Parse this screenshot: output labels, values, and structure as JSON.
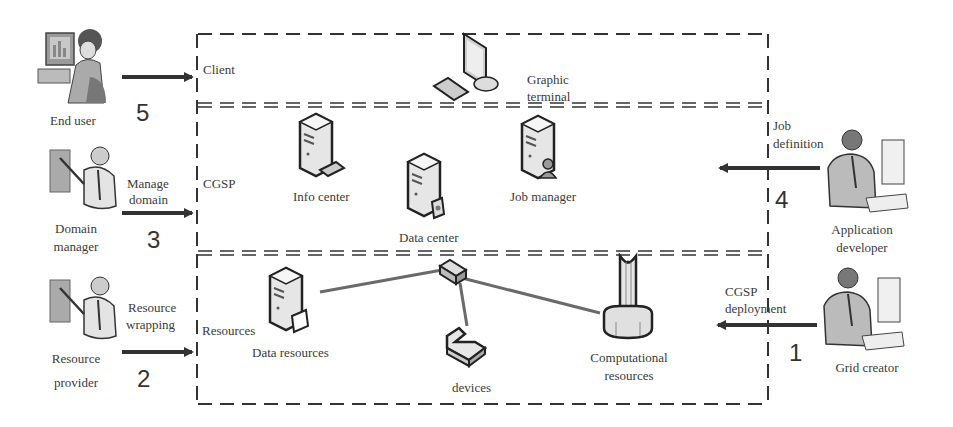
{
  "diagram": {
    "layers": [
      {
        "id": "client",
        "label": "Client"
      },
      {
        "id": "cgsp",
        "label": "CGSP"
      },
      {
        "id": "resources",
        "label": "Resources"
      }
    ],
    "nodes": {
      "graphic_terminal": {
        "line1": "Graphic",
        "line2": "terminal"
      },
      "info_center": {
        "label": "Info center"
      },
      "data_center": {
        "label": "Data center"
      },
      "job_manager": {
        "label": "Job manager"
      },
      "data_resources": {
        "label": "Data resources"
      },
      "devices": {
        "label": "devices"
      },
      "computational_resources": {
        "line1": "Computational",
        "line2": "resources"
      }
    },
    "actors": {
      "end_user": {
        "label": "End user"
      },
      "domain_manager": {
        "line1": "Domain",
        "line2": "manager"
      },
      "resource_provider": {
        "line1": "Resource",
        "line2": "provider"
      },
      "application_developer": {
        "line1": "Application",
        "line2": "developer"
      },
      "grid_creator": {
        "label": "Grid creator"
      }
    },
    "flows": [
      {
        "step": "5",
        "from": "End user",
        "to": "Client",
        "line1": "",
        "line2": ""
      },
      {
        "step": "3",
        "from": "Domain manager",
        "to": "CGSP",
        "line1": "Manage",
        "line2": "domain"
      },
      {
        "step": "2",
        "from": "Resource provider",
        "to": "Resources",
        "line1": "Resource",
        "line2": "wrapping"
      },
      {
        "step": "4",
        "from": "Application developer",
        "to": "CGSP",
        "line1": "Job",
        "line2": "definition"
      },
      {
        "step": "1",
        "from": "Grid creator",
        "to": "Resources",
        "line1": "CGSP",
        "line2": "deployment"
      }
    ],
    "colors": {
      "line": "#333333",
      "link": "#6a6a6a",
      "icon_fill": "#e8e8e8",
      "icon_stroke": "#222222"
    }
  }
}
